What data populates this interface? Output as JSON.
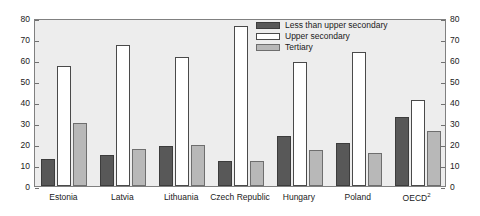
{
  "chart_data": {
    "type": "bar",
    "title": "",
    "xlabel": "",
    "ylabel": "",
    "ylim": [
      0,
      80
    ],
    "yticks": [
      0,
      10,
      20,
      30,
      40,
      50,
      60,
      70,
      80
    ],
    "ytick_labels": [
      "0",
      "10",
      "20",
      "30",
      "40",
      "50",
      "60",
      "70",
      "80"
    ],
    "right_axis": {
      "ylim": [
        0,
        80
      ],
      "yticks": [
        0,
        10,
        20,
        30,
        40,
        50,
        60,
        70,
        80
      ],
      "ytick_labels": [
        "0",
        "10",
        "20",
        "30",
        "40",
        "50",
        "60",
        "70",
        "80"
      ]
    },
    "grid": false,
    "legend_position": "upper right inside",
    "categories": [
      "Estonia",
      "Latvia",
      "Lithuania",
      "Czech Republic",
      "Hungary",
      "Poland",
      "OECD"
    ],
    "category_labels": [
      {
        "text": "Estonia",
        "sup": ""
      },
      {
        "text": "Latvia",
        "sup": ""
      },
      {
        "text": "Lithuania",
        "sup": ""
      },
      {
        "text": "Czech Republic",
        "sup": ""
      },
      {
        "text": "Hungary",
        "sup": ""
      },
      {
        "text": "Poland",
        "sup": ""
      },
      {
        "text": "OECD",
        "sup": "2"
      }
    ],
    "series": [
      {
        "name": "Less than upper secondary",
        "color": "#585858",
        "values": [
          13,
          15,
          19,
          12,
          24,
          20.5,
          33
        ]
      },
      {
        "name": "Upper secondary",
        "color": "#ffffff",
        "values": [
          57,
          67,
          61.5,
          76,
          59,
          64,
          41
        ]
      },
      {
        "name": "Tertiary",
        "color": "#b8b8b8",
        "values": [
          30,
          17.5,
          19.5,
          12,
          17,
          15.5,
          26
        ]
      }
    ]
  },
  "colors": {
    "plot_background": "#ededed",
    "axis": "#808080",
    "text": "#1a1a1a",
    "series_1": "#585858",
    "series_2": "#ffffff",
    "series_3": "#b8b8b8"
  }
}
